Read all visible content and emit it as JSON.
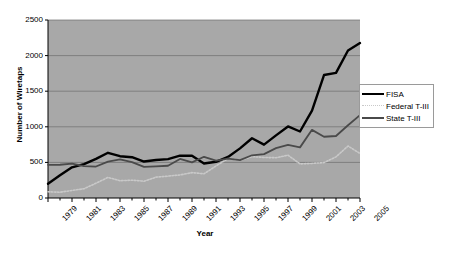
{
  "chart_data": {
    "type": "line",
    "title": "",
    "xlabel": "Year",
    "ylabel": "Number of Wiretaps",
    "xlim": [
      1979,
      2005
    ],
    "ylim": [
      0,
      2500
    ],
    "ytick_interval": 500,
    "yticks": [
      0,
      500,
      1000,
      1500,
      2000,
      2500
    ],
    "xticks": [
      1979,
      1981,
      1983,
      1985,
      1987,
      1989,
      1991,
      1993,
      1995,
      1997,
      1999,
      2001,
      2003,
      2005
    ],
    "x": [
      1979,
      1980,
      1981,
      1982,
      1983,
      1984,
      1985,
      1986,
      1987,
      1988,
      1989,
      1990,
      1991,
      1992,
      1993,
      1994,
      1995,
      1996,
      1997,
      1998,
      1999,
      2000,
      2001,
      2002,
      2003,
      2004,
      2005
    ],
    "grid": "horizontal",
    "legend_position": "right",
    "plot_background": "#a8a8a8",
    "gridline_color": "#6f6f6f",
    "series": [
      {
        "name": "FISA",
        "color": "#000000",
        "style": "solid-thick",
        "values": [
          199,
          319,
          431,
          475,
          549,
          635,
          587,
          573,
          512,
          534,
          546,
          595,
          593,
          484,
          509,
          576,
          697,
          839,
          749,
          880,
          1005,
          934,
          1228,
          1727,
          1758,
          2072,
          2176
        ]
      },
      {
        "name": "Federal T-III",
        "color": "#c9c9c9",
        "style": "dotted",
        "values": [
          87,
          81,
          106,
          130,
          208,
          289,
          243,
          250,
          236,
          293,
          307,
          324,
          356,
          340,
          450,
          554,
          532,
          581,
          569,
          566,
          601,
          479,
          486,
          497,
          578,
          730,
          625
        ]
      },
      {
        "name": "State T-III",
        "color": "#4a4a4a",
        "style": "solid-medium",
        "values": [
          466,
          467,
          483,
          448,
          442,
          512,
          541,
          504,
          437,
          445,
          453,
          548,
          500,
          579,
          526,
          554,
          533,
          600,
          617,
          700,
          746,
          711,
          957,
          860,
          871,
          1022,
          1164
        ]
      }
    ]
  },
  "legend": {
    "items": [
      {
        "label": "FISA"
      },
      {
        "label": "Federal T-III"
      },
      {
        "label": "State T-III"
      }
    ]
  }
}
